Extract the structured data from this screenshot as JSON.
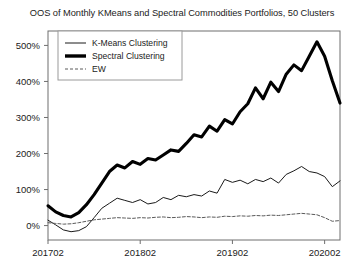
{
  "chart_data": {
    "type": "line",
    "title": "OOS of Monthly KMeans and Spectral Commodities Portfolios, 50 Clusters",
    "xlabel": "",
    "ylabel": "",
    "ylim": [
      -40,
      540
    ],
    "xlim": [
      0,
      38
    ],
    "grid": false,
    "legend_position": "upper left",
    "ytick_labels": [
      "0%",
      "100%",
      "200%",
      "300%",
      "400%",
      "500%"
    ],
    "ytick_values": [
      0,
      100,
      200,
      300,
      400,
      500
    ],
    "xtick_labels": [
      "201702",
      "201802",
      "201902",
      "202002"
    ],
    "xtick_values": [
      0,
      12,
      24,
      36
    ],
    "x": [
      0,
      1,
      2,
      3,
      4,
      5,
      6,
      7,
      8,
      9,
      10,
      11,
      12,
      13,
      14,
      15,
      16,
      17,
      18,
      19,
      20,
      21,
      22,
      23,
      24,
      25,
      26,
      27,
      28,
      29,
      30,
      31,
      32,
      33,
      34,
      35,
      36,
      37,
      38
    ],
    "series": [
      {
        "name": "K-Means Clustering",
        "style": "solid-thin",
        "color": "#1a1a1a",
        "values": [
          15,
          2,
          -12,
          -17,
          -14,
          -3,
          22,
          48,
          62,
          76,
          70,
          64,
          72,
          60,
          64,
          78,
          72,
          84,
          80,
          86,
          82,
          96,
          90,
          128,
          120,
          126,
          116,
          128,
          122,
          132,
          118,
          142,
          152,
          164,
          150,
          146,
          136,
          108,
          124
        ]
      },
      {
        "name": "Spectral Clustering",
        "style": "solid-thick",
        "color": "#000000",
        "values": [
          55,
          38,
          28,
          24,
          36,
          58,
          86,
          118,
          150,
          168,
          160,
          178,
          170,
          186,
          182,
          196,
          210,
          206,
          228,
          252,
          246,
          276,
          262,
          294,
          282,
          316,
          338,
          382,
          352,
          398,
          372,
          420,
          446,
          430,
          470,
          510,
          470,
          402,
          340
        ]
      },
      {
        "name": "EW",
        "style": "dashed",
        "color": "#5a5a5a",
        "values": [
          8,
          6,
          4,
          5,
          8,
          12,
          16,
          18,
          20,
          22,
          21,
          20,
          22,
          21,
          23,
          24,
          22,
          23,
          25,
          24,
          22,
          24,
          23,
          26,
          25,
          27,
          26,
          28,
          27,
          29,
          28,
          30,
          32,
          34,
          32,
          30,
          22,
          12,
          14
        ]
      }
    ]
  },
  "legend": {
    "items": [
      {
        "label": "K-Means Clustering"
      },
      {
        "label": "Spectral Clustering"
      },
      {
        "label": "EW"
      }
    ]
  }
}
